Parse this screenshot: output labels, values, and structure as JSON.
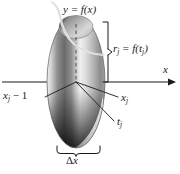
{
  "figure": {
    "background_color": "#ffffff",
    "ink_color": "#1a1a1a",
    "curve_color": "#e8e8e8",
    "labels": {
      "function_curve": "y = f(x)",
      "radius": "r",
      "radius_sub": "j",
      "radius_eq": " = f(t",
      "radius_close": ")",
      "radius_arg_sub": "j",
      "axis_x": "x",
      "left_partition": "x",
      "left_partition_sub": "j",
      "left_partition_tail": " − 1",
      "right_partition": "x",
      "right_partition_sub": "j",
      "sample_point": "t",
      "sample_point_sub": "j",
      "width_delta": "Δ",
      "width_var": "x"
    },
    "geometry": {
      "axis_y": 82,
      "axis_x_start": 2,
      "axis_x_end": 172,
      "disk_center_x": 76,
      "disk_center_y": 82,
      "disk_rx": 29,
      "disk_ry": 66,
      "cap_rx": 17,
      "cap_ry": 12,
      "brace_bottom_left": 57,
      "brace_bottom_right": 100,
      "bracket_x": 107,
      "bracket_top": 22,
      "bracket_bottom": 82
    }
  }
}
